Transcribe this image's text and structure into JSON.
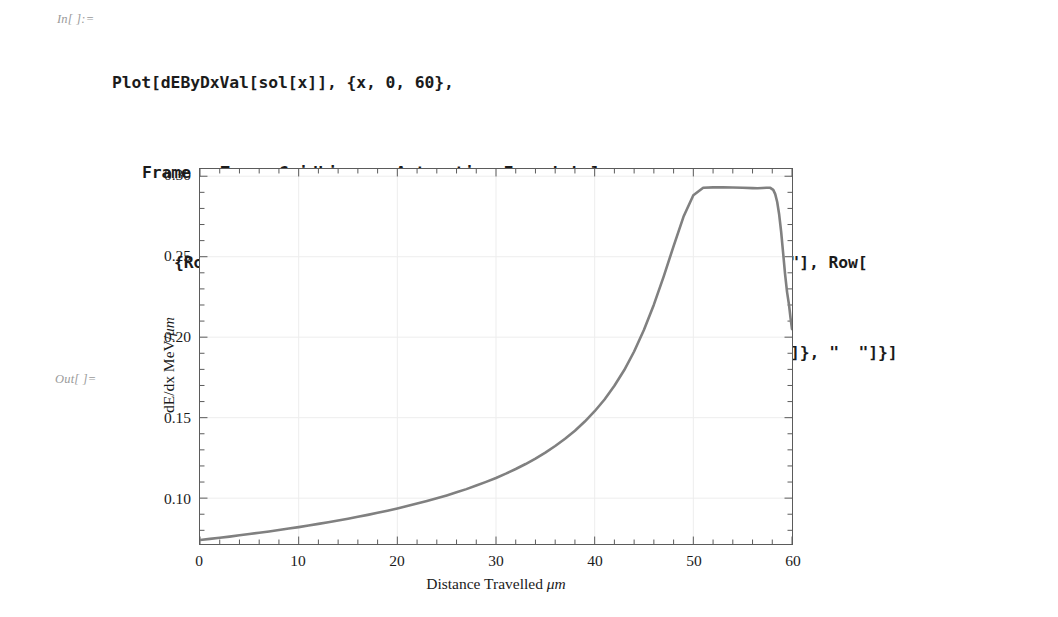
{
  "notebook": {
    "in_label": "In[ ]:=",
    "out_label": "Out[ ]=",
    "code_lines": [
      "Plot[dEByDxVal[sol[x]], {x, 0, 60},",
      "Frame → True, GridLines → Automatic, FrameLabel →",
      "{Row[{\"Distance Travelled\", Quantity[None, \"Micrometers\"]}, \"  \"], Row[",
      "{\"dE/dx\", Quantity[None, \"Megaelectronvolts\" / \"Micrometers\"]}, \"  \"]}]"
    ]
  },
  "chart_data": {
    "type": "line",
    "title": "",
    "xlabel": "Distance Travelled μm",
    "ylabel": "dE/dx MeV/μm",
    "xlabel_text": "Distance Travelled",
    "xlabel_unit": "μm",
    "ylabel_text": "dE/dx MeV/",
    "ylabel_unit": "μm",
    "xlim": [
      0,
      60
    ],
    "ylim": [
      0.0715,
      0.3045
    ],
    "grid": true,
    "grid_color": "#ededed",
    "frame_color": "#5b5b5b",
    "line_color": "#808080",
    "line_width": 2.6,
    "legend": null,
    "xticks": [
      0,
      10,
      20,
      30,
      40,
      50,
      60
    ],
    "xtick_labels": [
      "0",
      "10",
      "20",
      "30",
      "40",
      "50",
      "60"
    ],
    "x_minor_step": 2,
    "yticks": [
      0.1,
      0.15,
      0.2,
      0.25,
      0.3
    ],
    "ytick_labels": [
      "0.10",
      "0.15",
      "0.20",
      "0.25",
      "0.30"
    ],
    "y_minor_step": 0.01,
    "series": [
      {
        "name": "dE/dx",
        "x": [
          0,
          1,
          2,
          3,
          4,
          5,
          6,
          7,
          8,
          9,
          10,
          11,
          12,
          13,
          14,
          15,
          16,
          17,
          18,
          19,
          20,
          21,
          22,
          23,
          24,
          25,
          26,
          27,
          28,
          29,
          30,
          31,
          32,
          33,
          34,
          35,
          36,
          37,
          38,
          39,
          40,
          41,
          42,
          43,
          44,
          45,
          46,
          47,
          48,
          49,
          50,
          51,
          52,
          53,
          54,
          55,
          56,
          56.5,
          57,
          57.4,
          57.8,
          58.1,
          58.3,
          58.5,
          58.7,
          58.9,
          59.1,
          59.3,
          59.5,
          59.7,
          59.85,
          60
        ],
        "y": [
          0.074,
          0.0747,
          0.0754,
          0.0761,
          0.0769,
          0.0777,
          0.0785,
          0.0793,
          0.0802,
          0.0811,
          0.082,
          0.083,
          0.084,
          0.085,
          0.0861,
          0.0872,
          0.0884,
          0.0896,
          0.0909,
          0.0922,
          0.0936,
          0.0951,
          0.0966,
          0.0982,
          0.0999,
          0.1017,
          0.1036,
          0.1056,
          0.1078,
          0.1101,
          0.1125,
          0.1152,
          0.1181,
          0.1212,
          0.1246,
          0.1283,
          0.1324,
          0.1369,
          0.1419,
          0.1476,
          0.154,
          0.1613,
          0.1698,
          0.1796,
          0.1911,
          0.2046,
          0.2202,
          0.2378,
          0.2566,
          0.2748,
          0.2882,
          0.2929,
          0.2931,
          0.2932,
          0.293,
          0.2928,
          0.2926,
          0.2925,
          0.2927,
          0.2929,
          0.2928,
          0.2915,
          0.2889,
          0.284,
          0.2762,
          0.2655,
          0.2524,
          0.239,
          0.228,
          0.22,
          0.212,
          0.205
        ]
      }
    ]
  }
}
